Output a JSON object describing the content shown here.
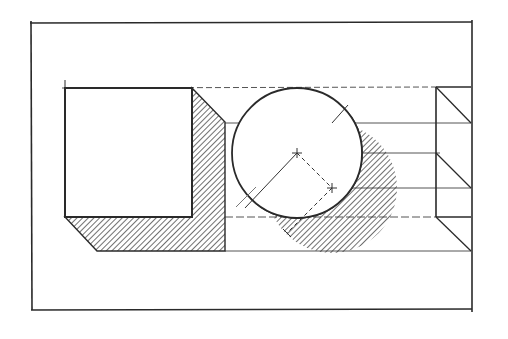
{
  "drawing": {
    "title": "Shadow construction: cube and sphere with side projection",
    "ink_color": "#2a2a2a",
    "construction_color": "#555555",
    "background": "#ffffff",
    "frame": {
      "x1": 30,
      "y1": 23,
      "x2": 472,
      "y2": 310
    },
    "cube": {
      "left": 65,
      "top": 88,
      "right": 192,
      "bottom": 217
    },
    "cube_shadow": {
      "offset": 34,
      "bottom": 251,
      "right": 225
    },
    "sphere": {
      "cx": 297,
      "cy": 153,
      "r": 65
    },
    "sphere_shadow": {
      "cx": 332,
      "cy": 188,
      "r": 65
    },
    "horizontal_lines_y": [
      88,
      123,
      153,
      188,
      217,
      251
    ],
    "side_view": {
      "left": 436,
      "right": 471,
      "top": 88,
      "bottom": 251
    }
  }
}
